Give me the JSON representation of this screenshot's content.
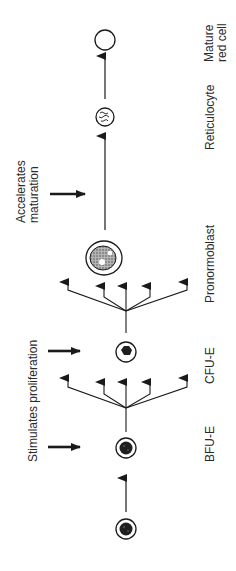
{
  "diagram": {
    "orientation": "rotated-90-ccw",
    "colors": {
      "line": "#1a1a1a",
      "nucleus": "#1f1f1f",
      "stippled": "#8a8a8a",
      "text": "#2a2a2a"
    },
    "stages": [
      {
        "id": "stem",
        "label": ""
      },
      {
        "id": "bfu-e",
        "label": "BFU-E"
      },
      {
        "id": "cfu-e",
        "label": "CFU-E"
      },
      {
        "id": "pronormoblast",
        "label": "Pronormoblast"
      },
      {
        "id": "reticulocyte",
        "label": "Reticulocyte"
      },
      {
        "id": "mature",
        "label_line1": "Mature",
        "label_line2": "red cell"
      }
    ],
    "effects": [
      {
        "id": "proliferation",
        "label": "Stimulates proliferation",
        "targets": [
          "bfu-e",
          "cfu-e"
        ]
      },
      {
        "id": "maturation",
        "label_line1": "Accelerates",
        "label_line2": "maturation",
        "targets": [
          "pronormoblast-to-reticulocyte"
        ]
      }
    ]
  }
}
